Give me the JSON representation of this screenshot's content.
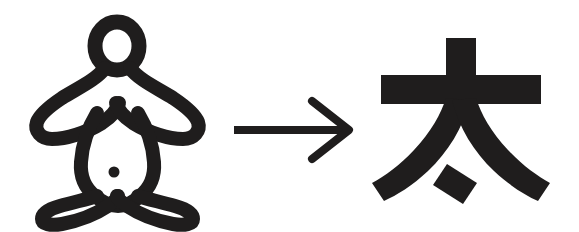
{
  "page": {
    "background_color": "#ffffff",
    "ink_color": "#1f1d1d",
    "width": 579,
    "height": 232
  },
  "panels": {
    "left": {
      "name": "ancient-pictograph",
      "label": "ancient pictograph of a standing person",
      "style": "outline",
      "parts": [
        "head-ring",
        "left-arm",
        "right-arm",
        "torso",
        "navel-dot",
        "left-leg",
        "right-leg"
      ]
    },
    "middle": {
      "name": "transformation-arrow",
      "label": "arrow",
      "glyph": "→",
      "direction": "right"
    },
    "right": {
      "name": "modern-character",
      "label": "太",
      "reading": "tài",
      "stroke_count": 4,
      "strokes": [
        "horizontal",
        "vertical",
        "left-falling",
        "right-falling",
        "dot"
      ]
    }
  },
  "accessibility": {
    "alt_text": "An outlined pictograph of a person with arms outstretched, an arrow pointing right, and the Chinese character tai"
  }
}
